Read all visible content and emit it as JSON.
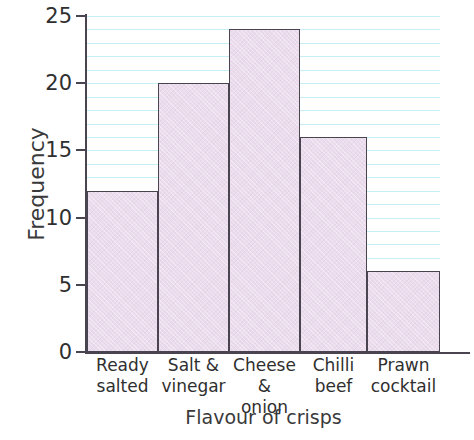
{
  "chart_data": {
    "type": "bar",
    "title": "",
    "subtitle": "",
    "xlabel": "Flavour of crisps",
    "ylabel": "Frequency",
    "categories": [
      "Ready salted",
      "Salt & vinegar",
      "Cheese & onion",
      "Chilli beef",
      "Prawn cocktail"
    ],
    "category_lines": [
      [
        "Ready",
        "salted"
      ],
      [
        "Salt &",
        "vinegar"
      ],
      [
        "Cheese &",
        "onion"
      ],
      [
        "Chilli",
        "beef"
      ],
      [
        "Prawn",
        "cocktail"
      ]
    ],
    "values": [
      12,
      20,
      24,
      16,
      6
    ],
    "ylim": [
      0,
      25
    ],
    "y_ticks": [
      0,
      5,
      10,
      15,
      20,
      25
    ],
    "y_tick_labels": [
      "0",
      "5",
      "10",
      "15",
      "20",
      "25"
    ],
    "x_ticks": [],
    "grid": true,
    "grid_orientation": "horizontal",
    "grid_step": 1,
    "legend": null,
    "legend_position": "none",
    "annotations": []
  },
  "style": {
    "bar_fill": "#eadcec",
    "bar_stroke": "#4a4450",
    "axis_color": "#4a4450",
    "grid_color": "#96e1f0",
    "text_color": "#2f2f2f",
    "background": "#ffffff"
  },
  "axes": {
    "y_title": "Frequency",
    "x_title": "Flavour of crisps"
  }
}
